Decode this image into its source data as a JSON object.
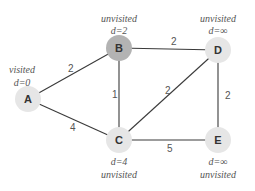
{
  "diagram": {
    "type": "weighted-graph",
    "colors": {
      "edge": "#3a3a3a",
      "node_visited": "#e6e6e6",
      "node_current": "#b3b3b3",
      "node_unvisited": "#e6e6e6",
      "annotation": "#555555"
    },
    "nodes": [
      {
        "id": "A",
        "label": "A",
        "x": 28,
        "y": 99,
        "status": "visited",
        "distance": "d=0"
      },
      {
        "id": "B",
        "label": "B",
        "x": 119,
        "y": 48,
        "status": "unvisited",
        "distance": "d=2"
      },
      {
        "id": "C",
        "label": "C",
        "x": 119,
        "y": 140,
        "status": "unvisited",
        "distance": "d=4"
      },
      {
        "id": "D",
        "label": "D",
        "x": 218,
        "y": 50,
        "status": "unvisited",
        "distance": "d=∞"
      },
      {
        "id": "E",
        "label": "E",
        "x": 218,
        "y": 140,
        "status": "unvisited",
        "distance": "d=∞"
      }
    ],
    "edges": [
      {
        "from": "A",
        "to": "B",
        "weight": "2"
      },
      {
        "from": "A",
        "to": "C",
        "weight": "4"
      },
      {
        "from": "B",
        "to": "C",
        "weight": "1"
      },
      {
        "from": "B",
        "to": "D",
        "weight": "2"
      },
      {
        "from": "C",
        "to": "D",
        "weight": "2"
      },
      {
        "from": "C",
        "to": "E",
        "weight": "5"
      },
      {
        "from": "D",
        "to": "E",
        "weight": "2"
      }
    ]
  }
}
